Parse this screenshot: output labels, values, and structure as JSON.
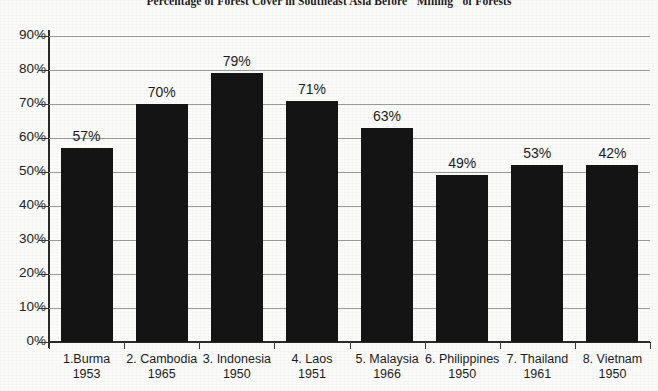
{
  "chart_data": {
    "type": "bar",
    "title": "Percentage of Forest Cover in Southeast Asia Before \"Mining\" of Forests",
    "xlabel": "",
    "ylabel": "",
    "ylim": [
      0,
      90
    ],
    "grid": true,
    "legend": "none",
    "categories": [
      "1.Burma",
      "2. Cambodia",
      "3. Indonesia",
      "4. Laos",
      "5. Malaysia",
      "6. Philippines",
      "7. Thailand",
      "8. Vietnam"
    ],
    "category_years": [
      "1953",
      "1965",
      "1950",
      "1951",
      "1966",
      "1950",
      "1961",
      "1950"
    ],
    "values": [
      57,
      70,
      79,
      71,
      63,
      49,
      53,
      42
    ],
    "bar_heights_percent": [
      57,
      70,
      79,
      71,
      63,
      49,
      52,
      52
    ],
    "data_labels": [
      "57%",
      "70%",
      "79%",
      "71%",
      "63%",
      "49%",
      "53%",
      "42%"
    ],
    "ytick_values": [
      0,
      10,
      20,
      30,
      40,
      50,
      60,
      70,
      80,
      90
    ],
    "ytick_labels": [
      "0%",
      "10%",
      "20%",
      "30%",
      "40%",
      "50%",
      "60%",
      "70%",
      "80%",
      "90%"
    ],
    "bar_color": "#141414",
    "gridline_color": "#9a9a9a",
    "axis_color": "#2a2a2a",
    "background_color": "#fbfbfa"
  }
}
